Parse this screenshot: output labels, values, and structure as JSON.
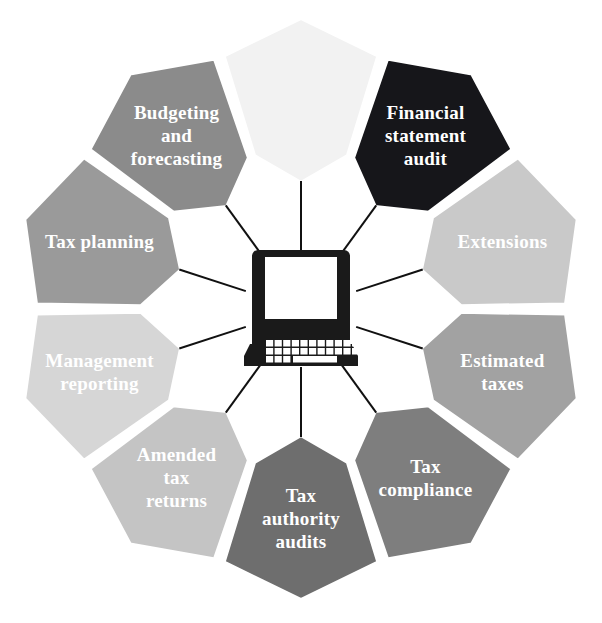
{
  "diagram": {
    "type": "radial-segmented-wheel",
    "center_icon": "laptop-icon",
    "segment_count": 10,
    "geometry": {
      "center_x": 301,
      "center_y": 309,
      "outer_radius": 291,
      "inner_radius": 126,
      "notch_depth": 34,
      "gap_degrees": 2.0,
      "start_angle_deg": -72
    },
    "colors": {
      "background": "#ffffff",
      "separator": "#ffffff",
      "spoke": "#111111",
      "label_text": "#ffffff",
      "hub_fill": "#ffffff",
      "icon_fill": "#1a1a1a"
    },
    "segments": [
      {
        "id": "financial-statement-audit",
        "label": "Financial\nstatement\naudit",
        "lines": [
          "Financial",
          "statement",
          "audit"
        ],
        "fill": "#16161a",
        "text_color": "#ffffff",
        "start_deg": -72,
        "end_deg": -36
      },
      {
        "id": "extensions",
        "label": "Extensions",
        "lines": [
          "Extensions"
        ],
        "fill": "#c9c9c9",
        "text_color": "#ffffff",
        "start_deg": -36,
        "end_deg": 0
      },
      {
        "id": "estimated-taxes",
        "label": "Estimated\ntaxes",
        "lines": [
          "Estimated",
          "taxes"
        ],
        "fill": "#a2a2a2",
        "text_color": "#ffffff",
        "start_deg": 0,
        "end_deg": 36
      },
      {
        "id": "tax-compliance",
        "label": "Tax\ncompliance",
        "lines": [
          "Tax",
          "compliance"
        ],
        "fill": "#7e7e7e",
        "text_color": "#ffffff",
        "start_deg": 36,
        "end_deg": 72
      },
      {
        "id": "tax-authority-audits",
        "label": "Tax\nauthority\naudits",
        "lines": [
          "Tax",
          "authority",
          "audits"
        ],
        "fill": "#6e6e6e",
        "text_color": "#ffffff",
        "start_deg": 72,
        "end_deg": 108
      },
      {
        "id": "amended-tax-returns",
        "label": "Amended\ntax\nreturns",
        "lines": [
          "Amended",
          "tax",
          "returns"
        ],
        "fill": "#c4c4c4",
        "text_color": "#ffffff",
        "start_deg": 108,
        "end_deg": 144
      },
      {
        "id": "management-reporting",
        "label": "Management\nreporting",
        "lines": [
          "Management",
          "reporting"
        ],
        "fill": "#d6d6d6",
        "text_color": "#ffffff",
        "start_deg": 144,
        "end_deg": 180
      },
      {
        "id": "tax-planning",
        "label": "Tax planning",
        "lines": [
          "Tax planning"
        ],
        "fill": "#9a9a9a",
        "text_color": "#ffffff",
        "start_deg": 180,
        "end_deg": 216
      },
      {
        "id": "budgeting-and-forecasting",
        "label": "Budgeting\nand\nforecasting",
        "lines": [
          "Budgeting",
          "and",
          "forecasting"
        ],
        "fill": "#8b8b8b",
        "text_color": "#ffffff",
        "start_deg": 216,
        "end_deg": 252
      },
      {
        "id": "unlabeled-top",
        "label": "",
        "lines": [
          ""
        ],
        "fill": "#f2f2f2",
        "text_color": "#ffffff",
        "start_deg": 252,
        "end_deg": 288
      }
    ]
  }
}
